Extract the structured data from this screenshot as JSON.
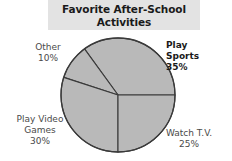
{
  "title": {
    "line1": "Favorite After-School",
    "line2": "Activities",
    "band_color": "#e3e3e3"
  },
  "chart_data": {
    "type": "pie",
    "title": "Favorite After-School Activities",
    "xlabel": "",
    "ylabel": "",
    "grid": false,
    "legend": "none",
    "label_position": "outside",
    "units": "percent",
    "start_angle_deg": 0,
    "direction": "counterclockwise",
    "categories": [
      "Play Sports",
      "Other",
      "Play Video Games",
      "Watch T.V."
    ],
    "values": [
      35,
      10,
      30,
      25
    ],
    "slices": [
      {
        "name": "Play Sports",
        "label_line1": "Play",
        "label_line2": "Sports",
        "value": 35,
        "value_label": "35%",
        "fill": "#b9b9b9",
        "stroke": "#3a3a3a",
        "start_deg": 0,
        "end_deg": 126,
        "bold": true
      },
      {
        "name": "Other",
        "label_line1": "Other",
        "label_line2": "",
        "value": 10,
        "value_label": "10%",
        "fill": "#b9b9b9",
        "stroke": "#3a3a3a",
        "start_deg": 126,
        "end_deg": 162,
        "bold": false
      },
      {
        "name": "Play Video Games",
        "label_line1": "Play Video",
        "label_line2": "Games",
        "value": 30,
        "value_label": "30%",
        "fill": "#b9b9b9",
        "stroke": "#3a3a3a",
        "start_deg": 162,
        "end_deg": 270,
        "bold": false
      },
      {
        "name": "Watch T.V.",
        "label_line1": "Watch T.V.",
        "label_line2": "",
        "value": 25,
        "value_label": "25%",
        "fill": "#b9b9b9",
        "stroke": "#3a3a3a",
        "start_deg": 270,
        "end_deg": 360,
        "bold": false
      }
    ],
    "geometry": {
      "center_x": 118,
      "center_y": 95,
      "radius": 57
    },
    "colors": {
      "slice_fill": "#b9b9b9",
      "slice_stroke": "#3a3a3a",
      "title_band": "#e3e3e3",
      "label_text": "#4a4a4a",
      "emphasis_text": "#1a1a1a",
      "background": "#ffffff"
    }
  }
}
